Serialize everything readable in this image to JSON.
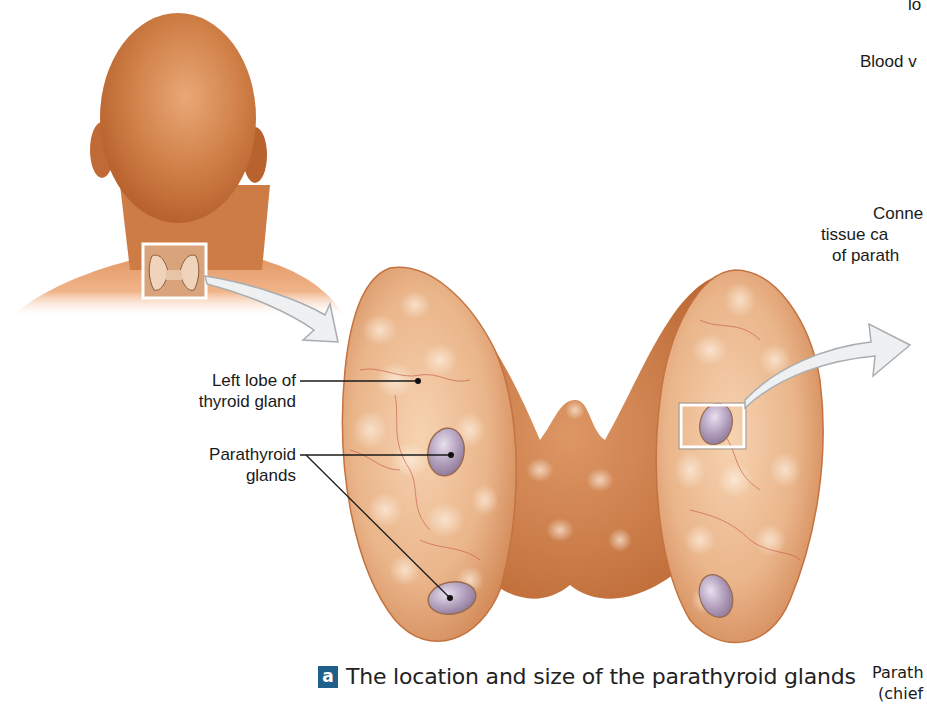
{
  "figure": {
    "caption_letter": "a",
    "caption_text": "The location and size of the parathyroid glands",
    "colors": {
      "skin": "#d98a4e",
      "thyroid": "#e3a070",
      "thyroid_shadow": "#c4703c",
      "parathyroid": "#b4a2bd",
      "badge": "#1f5f8b",
      "arrow_fill": "#eef0f2",
      "arrow_stroke": "#a9adb0"
    }
  },
  "labels": {
    "left_lobe_line1": "Left lobe of",
    "left_lobe_line2": "thyroid gland",
    "parathyroid_line1": "Parathyroid",
    "parathyroid_line2": "glands"
  },
  "cutoff_labels": {
    "top_partial": "lo",
    "blood_vessels_partial": "Blood v",
    "connective_line1": "Conne",
    "connective_line2": "tissue ca",
    "connective_line3": "of parath",
    "bottom_line1": "Parath",
    "bottom_line2": "(chief"
  }
}
